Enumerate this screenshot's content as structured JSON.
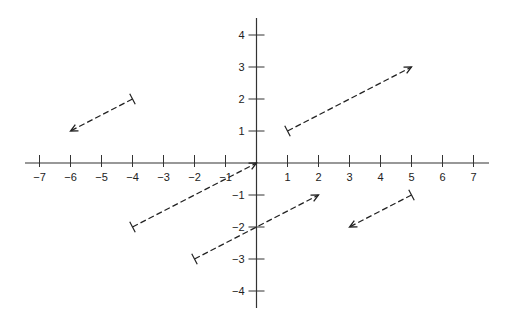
{
  "diagram": {
    "type": "vector-field-plot",
    "axes": {
      "x_ticks": [
        -7,
        -6,
        -5,
        -4,
        -3,
        -2,
        -1,
        1,
        2,
        3,
        4,
        5,
        6,
        7
      ],
      "y_ticks": [
        -4,
        -3,
        -2,
        -1,
        1,
        2,
        3,
        4
      ],
      "x_range": [
        -7,
        7
      ],
      "y_range": [
        -4,
        4
      ]
    },
    "vectors": [
      {
        "from": [
          -4,
          2
        ],
        "to": [
          -6,
          1
        ]
      },
      {
        "from": [
          1,
          1
        ],
        "to": [
          5,
          3
        ]
      },
      {
        "from": [
          -4,
          -2
        ],
        "to": [
          0,
          0
        ]
      },
      {
        "from": [
          -2,
          -3
        ],
        "to": [
          2,
          -1
        ]
      },
      {
        "from": [
          5,
          -1
        ],
        "to": [
          3,
          -2
        ]
      }
    ],
    "colors": {
      "axis": "#333333",
      "vector": "#222222"
    }
  }
}
